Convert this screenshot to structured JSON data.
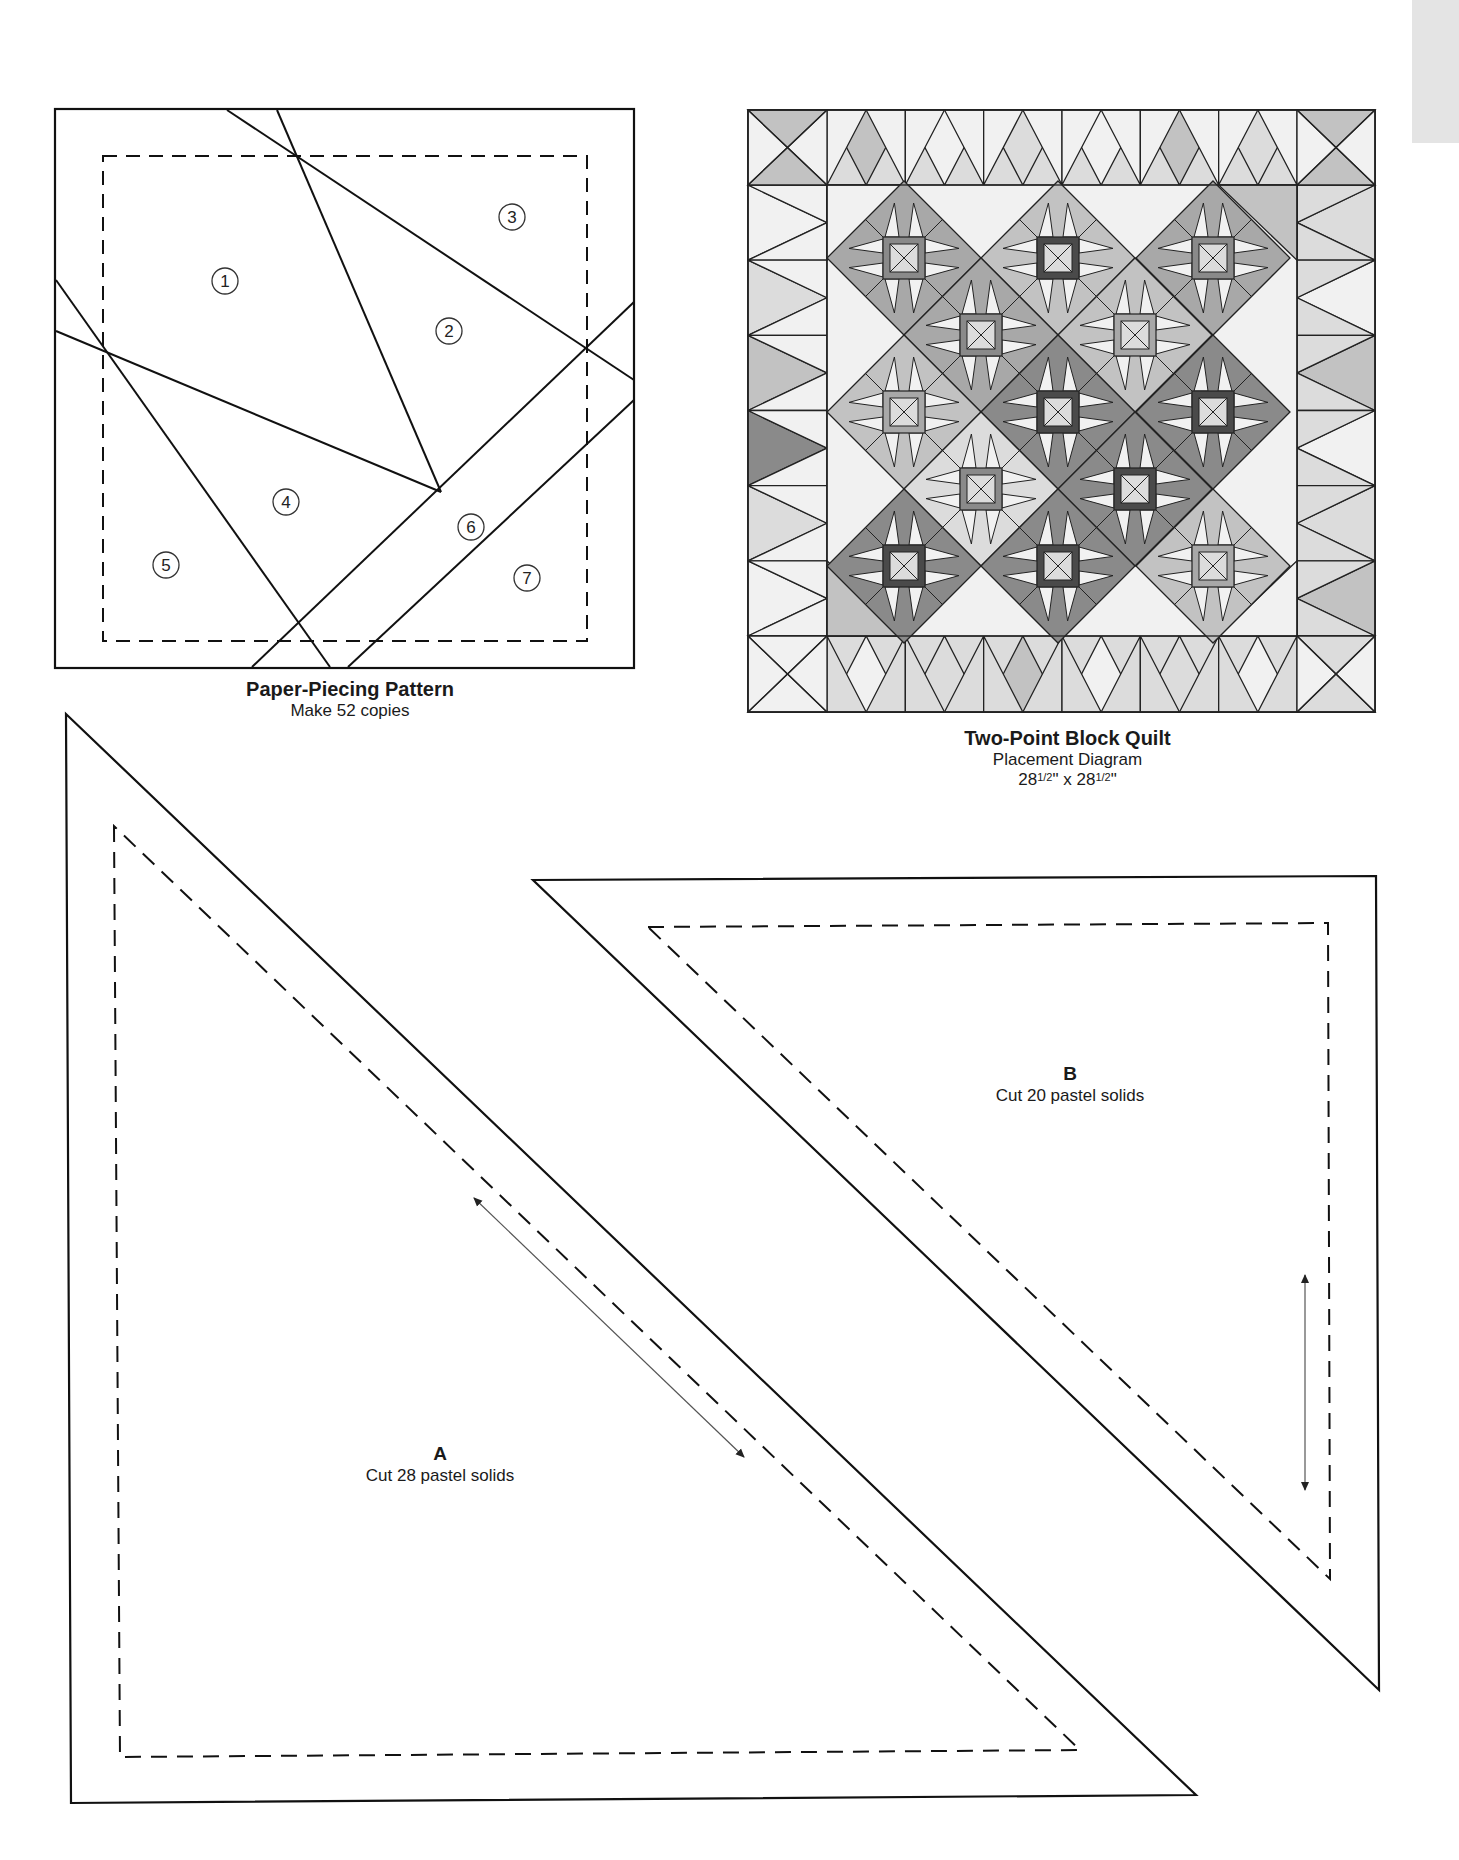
{
  "paper_piecing": {
    "title": "Paper-Piecing Pattern",
    "subtitle": "Make 52 copies",
    "numbers": [
      {
        "n": "1",
        "x": 225,
        "y": 281
      },
      {
        "n": "2",
        "x": 449,
        "y": 331
      },
      {
        "n": "3",
        "x": 512,
        "y": 217
      },
      {
        "n": "4",
        "x": 286,
        "y": 502
      },
      {
        "n": "5",
        "x": 166,
        "y": 565
      },
      {
        "n": "6",
        "x": 471,
        "y": 527
      },
      {
        "n": "7",
        "x": 527,
        "y": 578
      }
    ]
  },
  "quilt": {
    "title": "Two-Point Block Quilt",
    "subtitle": "Placement Diagram",
    "size_a": "28",
    "size_a_frac": "1/2",
    "size_sep": "\" x ",
    "size_b": "28",
    "size_b_frac": "1/2",
    "size_end": "\"",
    "colors": {
      "light": "#f1f1f1",
      "pale": "#dcdcdc",
      "mid": "#c2c2c2",
      "medium": "#a8a8a8",
      "dark": "#8a8a8a",
      "darkest": "#4a4a4a",
      "line": "#222222"
    }
  },
  "template_a": {
    "letter": "A",
    "instruction": "Cut 28 pastel solids"
  },
  "template_b": {
    "letter": "B",
    "instruction": "Cut 20 pastel solids"
  }
}
